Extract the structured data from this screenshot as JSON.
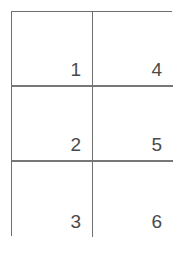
{
  "diagram": {
    "type": "grid-table",
    "title": "",
    "background_color": "#ffffff",
    "line_color": "#6e6e6e",
    "divider_color": "#777777",
    "text_color": "#4a4a4a",
    "rows": 3,
    "columns": 2,
    "number_alignment": "bottom-right",
    "cells": [
      {
        "id": "cell-1",
        "label": "1",
        "row": 1,
        "column": 1
      },
      {
        "id": "cell-4",
        "label": "4",
        "row": 1,
        "column": 2
      },
      {
        "id": "cell-2",
        "label": "2",
        "row": 2,
        "column": 1
      },
      {
        "id": "cell-5",
        "label": "5",
        "row": 2,
        "column": 2
      },
      {
        "id": "cell-3",
        "label": "3",
        "row": 3,
        "column": 1
      },
      {
        "id": "cell-6",
        "label": "6",
        "row": 3,
        "column": 2
      }
    ]
  }
}
